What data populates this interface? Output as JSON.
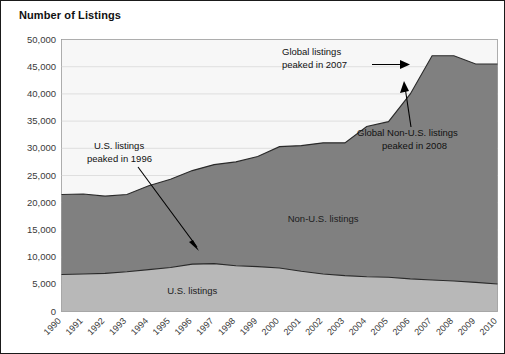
{
  "figure": {
    "title": "Number of Listings",
    "border_color": "#1a1a1a",
    "background": "#ffffff"
  },
  "chart_data": {
    "type": "area",
    "stacked": true,
    "title": "Number of Listings",
    "xlabel": "",
    "ylabel": "Number of Listings",
    "ylim": [
      0,
      50000
    ],
    "xlim": [
      1990,
      2010
    ],
    "grid": true,
    "legend_position": "inline-labels",
    "ytick_labels": [
      "0",
      "5,000",
      "10,000",
      "15,000",
      "20,000",
      "25,000",
      "30,000",
      "35,000",
      "40,000",
      "45,000",
      "50,000"
    ],
    "ytick_values": [
      0,
      5000,
      10000,
      15000,
      20000,
      25000,
      30000,
      35000,
      40000,
      45000,
      50000
    ],
    "categories": [
      1990,
      1991,
      1992,
      1993,
      1994,
      1995,
      1996,
      1997,
      1998,
      1999,
      2000,
      2001,
      2002,
      2003,
      2004,
      2005,
      2006,
      2007,
      2008,
      2009,
      2010
    ],
    "xtick_labels": [
      "1990",
      "1991",
      "1992",
      "1993",
      "1994",
      "1995",
      "1996",
      "1997",
      "1998",
      "1999",
      "2000",
      "2001",
      "2002",
      "2003",
      "2004",
      "2005",
      "2006",
      "2007",
      "2008",
      "2009",
      "2010"
    ],
    "series": [
      {
        "name": "U.S. listings",
        "color": "#b8b8b8",
        "values": [
          6800,
          6900,
          7000,
          7300,
          7700,
          8100,
          8700,
          8800,
          8400,
          8250,
          8000,
          7400,
          6900,
          6600,
          6400,
          6300,
          6000,
          5800,
          5600,
          5350,
          5050
        ]
      },
      {
        "name": "Non-U.S. listings",
        "color": "#808080",
        "values": [
          14700,
          14700,
          14200,
          14200,
          15400,
          16200,
          17200,
          18200,
          19100,
          20250,
          22300,
          23100,
          24100,
          24400,
          27600,
          28600,
          34000,
          41200,
          41400,
          40150,
          40450
        ]
      }
    ],
    "total_values": [
      21500,
      21600,
      21200,
      21500,
      23100,
      24300,
      25900,
      27000,
      27500,
      28500,
      30300,
      30500,
      31000,
      31000,
      34000,
      34900,
      40000,
      47000,
      47000,
      45500,
      45500
    ],
    "annotations": [
      {
        "id": "us-peak",
        "text_line1": "U.S. listings",
        "text_line2": "peaked in 1996",
        "target_year": 1998,
        "target_value": 9500,
        "arrow": "down-right"
      },
      {
        "id": "global-peak",
        "text_line1": "Global listings",
        "text_line2": "peaked in 2007",
        "target_year": 2006,
        "target_value": 46200,
        "arrow": "right"
      },
      {
        "id": "global-nonus-peak",
        "text_line1": "Global Non-U.S. listings",
        "text_line2": "peaked in 2008",
        "target_year": 2007,
        "target_value": 35000,
        "arrow": "up"
      }
    ],
    "inline_labels": [
      {
        "text": "Non-U.S. listings",
        "x_year": 2002,
        "y_value": 16500
      },
      {
        "text": "U.S. listings",
        "x_year": 1996,
        "y_value": 3200
      }
    ]
  }
}
